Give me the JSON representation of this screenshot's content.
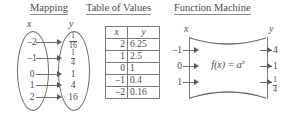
{
  "headings": {
    "mapping": "Mapping",
    "table": "Table of Values",
    "machine": "Function Machine"
  },
  "mapping": {
    "x_label": "x",
    "y_label": "y",
    "x_values": [
      "–2",
      "–1",
      "0",
      "1",
      "2"
    ],
    "y_values": [
      {
        "type": "fraction",
        "numer": "1",
        "denom": "16",
        "text": "1/16"
      },
      {
        "type": "fraction",
        "numer": "1",
        "denom": "4",
        "text": "1/4"
      },
      {
        "type": "integer",
        "text": "1"
      },
      {
        "type": "integer",
        "text": "4"
      },
      {
        "type": "integer",
        "text": "16"
      }
    ],
    "pairs": [
      {
        "x": "–2",
        "y": "1/16"
      },
      {
        "x": "–1",
        "y": "1/4"
      },
      {
        "x": "0",
        "y": "1"
      },
      {
        "x": "1",
        "y": "4"
      },
      {
        "x": "2",
        "y": "16"
      }
    ]
  },
  "table": {
    "headers": [
      "x",
      "y"
    ],
    "rows": [
      {
        "x": "2",
        "y": "6.25"
      },
      {
        "x": "1",
        "y": "2.5"
      },
      {
        "x": "0",
        "y": "1"
      },
      {
        "x": "–1",
        "y": "0.4"
      },
      {
        "x": "–2",
        "y": "0.16"
      }
    ]
  },
  "machine": {
    "x_label": "x",
    "y_label": "y",
    "formula": "f(x) = a",
    "formula_exponent": "x",
    "inputs": [
      "–1",
      "0",
      "1"
    ],
    "outputs": [
      {
        "type": "integer",
        "text": "4"
      },
      {
        "type": "integer",
        "text": "1"
      },
      {
        "type": "fraction",
        "numer": "1",
        "denom": "4",
        "text": "1/4"
      }
    ],
    "pairs": [
      {
        "input": "–1",
        "output": "4"
      },
      {
        "input": "0",
        "output": "1"
      },
      {
        "input": "1",
        "output": "1/4"
      }
    ]
  },
  "colors": {
    "ink": "#4a4a4a",
    "stroke": "#6b6b6b",
    "background": "#ffffff"
  }
}
